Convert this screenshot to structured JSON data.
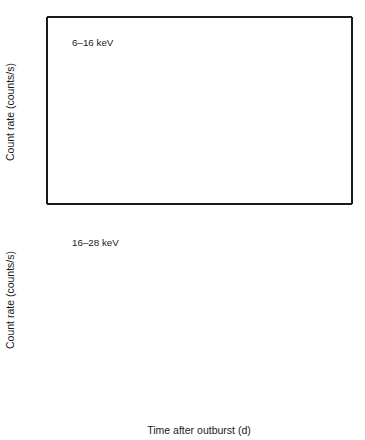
{
  "figure": {
    "width": 365,
    "height": 440,
    "background": "#ffffff",
    "ink_color": "#1a1a1a",
    "marker_color": "#1a1a1a",
    "errorbar_color": "#3a3a3a"
  },
  "axis": {
    "xlabel": "Time after outburst (d)",
    "ylabel": "Count rate (counts/s)",
    "xticklabels": [
      "0",
      "50",
      "100",
      "150",
      "200",
      "250",
      "300",
      "350",
      "400",
      "450"
    ],
    "top_yticklabels": [
      "0",
      "5",
      "10"
    ],
    "bottom_yticklabels": [
      "0",
      "1",
      "2"
    ]
  },
  "chart_data": [
    {
      "type": "scatter",
      "panel": "top",
      "title": "",
      "annotation": "6–16 keV",
      "xlabel": "",
      "ylabel": "Count rate (counts/s)",
      "xlim": [
        0,
        450
      ],
      "ylim": [
        0,
        14
      ],
      "xticks": [
        0,
        50,
        100,
        150,
        200,
        250,
        300,
        350,
        400,
        450
      ],
      "yticks": [
        0,
        5,
        10
      ],
      "yminor_step": 1,
      "xminor_step": 10,
      "grid": false,
      "legend": null,
      "marker": "open-circle-with-center-dot",
      "points": [
        {
          "x": 131,
          "y": 3.45,
          "yerr": 1.9
        },
        {
          "x": 147,
          "y": 3.3,
          "yerr": 1.15
        },
        {
          "x": 161,
          "y": 4.8,
          "yerr": 0.95
        },
        {
          "x": 193,
          "y": 5.4,
          "yerr": 0.75
        },
        {
          "x": 218,
          "y": 3.2,
          "yerr": 0.75
        },
        {
          "x": 235,
          "y": 4.5,
          "yerr": 1.5
        },
        {
          "x": 254,
          "y": 5.55,
          "yerr": 1.15
        },
        {
          "x": 265,
          "y": 6.55,
          "yerr": 1.55
        },
        {
          "x": 291,
          "y": 4.35,
          "yerr": 0.95
        },
        {
          "x": 306,
          "y": 2.1,
          "yerr": 0.75
        },
        {
          "x": 318,
          "y": 8.3,
          "yerr": 1.15
        },
        {
          "x": 322,
          "y": 10.4,
          "yerr": 0.75
        },
        {
          "x": 330,
          "y": 13.0,
          "yerr": 0.95
        },
        {
          "x": 331,
          "y": 13.3,
          "yerr": 0.75
        },
        {
          "x": 332,
          "y": 12.3,
          "yerr": 0.75
        },
        {
          "x": 333,
          "y": 11.8,
          "yerr": 0.6
        },
        {
          "x": 334,
          "y": 9.9,
          "yerr": 0.6
        },
        {
          "x": 335,
          "y": 9.6,
          "yerr": 0.55
        },
        {
          "x": 336,
          "y": 9.35,
          "yerr": 0.55
        },
        {
          "x": 338,
          "y": 10.3,
          "yerr": 0.9
        },
        {
          "x": 340,
          "y": 9.8,
          "yerr": 0.6
        },
        {
          "x": 343,
          "y": 8.6,
          "yerr": 0.8
        },
        {
          "x": 347,
          "y": 8.9,
          "yerr": 0.6
        },
        {
          "x": 356,
          "y": 5.3,
          "yerr": 0.9
        },
        {
          "x": 359,
          "y": 6.75,
          "yerr": 0.9
        },
        {
          "x": 367,
          "y": 5.5,
          "yerr": 0.95
        },
        {
          "x": 385,
          "y": 4.1,
          "yerr": 0.8
        },
        {
          "x": 387,
          "y": 2.95,
          "yerr": 1.25
        },
        {
          "x": 415,
          "y": 3.4,
          "yerr": 0.8
        },
        {
          "x": 431,
          "y": 3.7,
          "yerr": 1.35
        }
      ]
    },
    {
      "type": "scatter",
      "panel": "bottom",
      "title": "",
      "annotation": "16–28 keV",
      "xlabel": "Time after outburst (d)",
      "ylabel": "Count rate (counts/s)",
      "xlim": [
        0,
        450
      ],
      "ylim": [
        0,
        2.85
      ],
      "xticks": [
        0,
        50,
        100,
        150,
        200,
        250,
        300,
        350,
        400,
        450
      ],
      "yticks": [
        0,
        1,
        2
      ],
      "yminor_step": 0.5,
      "xminor_step": 10,
      "grid": false,
      "legend": null,
      "marker": "open-circle-with-center-dot",
      "points": [
        {
          "x": 131,
          "y": 0.87,
          "yerr": 0.25
        },
        {
          "x": 147,
          "y": 0.58,
          "yerr": 0.27
        },
        {
          "x": 161,
          "y": 0.86,
          "yerr": 0.2
        },
        {
          "x": 193,
          "y": 1.06,
          "yerr": 0.22
        },
        {
          "x": 218,
          "y": 1.07,
          "yerr": 0.22
        },
        {
          "x": 235,
          "y": 1.76,
          "yerr": 0.73
        },
        {
          "x": 254,
          "y": 1.27,
          "yerr": 0.42
        },
        {
          "x": 265,
          "y": 1.21,
          "yerr": 0.55
        },
        {
          "x": 291,
          "y": 1.06,
          "yerr": 0.22
        },
        {
          "x": 306,
          "y": 0.97,
          "yerr": 0.2
        },
        {
          "x": 318,
          "y": 1.95,
          "yerr": 0.27
        },
        {
          "x": 322,
          "y": 1.93,
          "yerr": 0.18
        },
        {
          "x": 328,
          "y": 2.15,
          "yerr": 0.2
        },
        {
          "x": 330,
          "y": 2.53,
          "yerr": 0.28
        },
        {
          "x": 332,
          "y": 2.27,
          "yerr": 0.2
        },
        {
          "x": 333,
          "y": 2.22,
          "yerr": 0.18
        },
        {
          "x": 334,
          "y": 1.85,
          "yerr": 0.18
        },
        {
          "x": 335,
          "y": 1.8,
          "yerr": 0.17
        },
        {
          "x": 336,
          "y": 1.61,
          "yerr": 0.2
        },
        {
          "x": 339,
          "y": 1.82,
          "yerr": 0.2
        },
        {
          "x": 342,
          "y": 1.8,
          "yerr": 0.2
        },
        {
          "x": 345,
          "y": 1.97,
          "yerr": 0.25
        },
        {
          "x": 351,
          "y": 1.59,
          "yerr": 0.3
        },
        {
          "x": 356,
          "y": 1.62,
          "yerr": 0.3
        },
        {
          "x": 359,
          "y": 1.16,
          "yerr": 0.28
        },
        {
          "x": 367,
          "y": 1.53,
          "yerr": 0.3
        },
        {
          "x": 385,
          "y": 1.41,
          "yerr": 0.3
        },
        {
          "x": 387,
          "y": 0.81,
          "yerr": 0.35
        },
        {
          "x": 415,
          "y": 1.0,
          "yerr": 0.28
        },
        {
          "x": 431,
          "y": 1.18,
          "yerr": 0.28
        }
      ]
    }
  ]
}
